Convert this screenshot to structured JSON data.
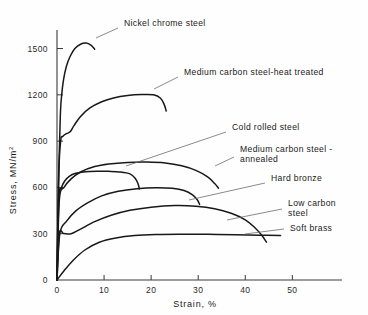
{
  "chart_data": {
    "type": "line",
    "title": "",
    "xlabel": "Strain,  %",
    "ylabel": "Stress,   MN/m",
    "ylabel_sup": "2",
    "xlim": [
      0,
      58
    ],
    "ylim": [
      0,
      1620
    ],
    "xticks": [
      0,
      10,
      20,
      30,
      40,
      50
    ],
    "xtick_labels": [
      "0",
      "10",
      "20",
      "30",
      "40",
      "50"
    ],
    "yticks": [
      0,
      300,
      600,
      900,
      1200,
      1500
    ],
    "ytick_labels": [
      "0",
      "300",
      "600",
      "900",
      "1200",
      "1500"
    ],
    "grid": false,
    "legend": "annotations",
    "series": [
      {
        "name": "Nickel chrome steel",
        "points": [
          [
            0,
            0
          ],
          [
            0.3,
            620
          ],
          [
            0.7,
            1060
          ],
          [
            1.0,
            1200
          ],
          [
            1.4,
            1300
          ],
          [
            2.0,
            1385
          ],
          [
            2.8,
            1450
          ],
          [
            3.8,
            1500
          ],
          [
            5.0,
            1528
          ],
          [
            6.2,
            1535
          ],
          [
            7.2,
            1522
          ],
          [
            8.0,
            1496
          ]
        ]
      },
      {
        "name": "Medium carbon steel-heat treated",
        "points": [
          [
            0,
            0
          ],
          [
            0.4,
            700
          ],
          [
            0.8,
            905
          ],
          [
            1.2,
            930
          ],
          [
            2.0,
            948
          ],
          [
            2.8,
            960
          ],
          [
            3.6,
            1000
          ],
          [
            5.0,
            1060
          ],
          [
            7.0,
            1115
          ],
          [
            9.5,
            1155
          ],
          [
            12.0,
            1180
          ],
          [
            15.0,
            1196
          ],
          [
            18.0,
            1202
          ],
          [
            20.5,
            1200
          ],
          [
            22.0,
            1178
          ],
          [
            22.8,
            1135
          ],
          [
            23.2,
            1095
          ]
        ]
      },
      {
        "name": "Cold rolled steel",
        "points": [
          [
            0,
            0
          ],
          [
            0.5,
            520
          ],
          [
            1.5,
            600
          ],
          [
            3.0,
            655
          ],
          [
            5.0,
            700
          ],
          [
            8.0,
            735
          ],
          [
            11.0,
            752
          ],
          [
            15.0,
            762
          ],
          [
            19.0,
            764
          ],
          [
            23.0,
            758
          ],
          [
            26.5,
            740
          ],
          [
            29.5,
            710
          ],
          [
            32.0,
            668
          ],
          [
            33.5,
            625
          ],
          [
            34.3,
            595
          ]
        ]
      },
      {
        "name": "Medium carbon steel - annealed",
        "points": [
          [
            0,
            0
          ],
          [
            0.4,
            530
          ],
          [
            0.9,
            595
          ],
          [
            1.6,
            640
          ],
          [
            2.6,
            672
          ],
          [
            4.0,
            692
          ],
          [
            6.0,
            702
          ],
          [
            8.5,
            705
          ],
          [
            11.0,
            704
          ],
          [
            13.5,
            700
          ],
          [
            15.5,
            688
          ],
          [
            16.6,
            660
          ],
          [
            17.2,
            625
          ],
          [
            17.5,
            590
          ]
        ]
      },
      {
        "name": "Hard bronze",
        "points": [
          [
            0,
            0
          ],
          [
            0.6,
            300
          ],
          [
            2.0,
            380
          ],
          [
            4.0,
            448
          ],
          [
            6.5,
            500
          ],
          [
            9.5,
            545
          ],
          [
            13.0,
            575
          ],
          [
            17.0,
            592
          ],
          [
            21.0,
            598
          ],
          [
            24.5,
            594
          ],
          [
            27.0,
            580
          ],
          [
            28.8,
            552
          ],
          [
            29.8,
            520
          ],
          [
            30.3,
            490
          ]
        ]
      },
      {
        "name": "Low carbon steel",
        "points": [
          [
            0,
            0
          ],
          [
            0.5,
            300
          ],
          [
            1.4,
            302
          ],
          [
            3.0,
            300
          ],
          [
            5.0,
            330
          ],
          [
            8.0,
            378
          ],
          [
            11.5,
            420
          ],
          [
            15.5,
            452
          ],
          [
            20.0,
            472
          ],
          [
            25.0,
            482
          ],
          [
            29.5,
            478
          ],
          [
            33.5,
            462
          ],
          [
            37.0,
            432
          ],
          [
            40.0,
            390
          ],
          [
            42.0,
            340
          ],
          [
            43.5,
            290
          ],
          [
            44.5,
            245
          ]
        ]
      },
      {
        "name": "Soft brass",
        "points": [
          [
            0,
            0
          ],
          [
            1.5,
            60
          ],
          [
            3.5,
            130
          ],
          [
            6.0,
            196
          ],
          [
            9.0,
            245
          ],
          [
            12.5,
            272
          ],
          [
            16.5,
            288
          ],
          [
            21.0,
            295
          ],
          [
            26.0,
            297
          ],
          [
            32.0,
            296
          ],
          [
            38.0,
            293
          ],
          [
            43.0,
            290
          ],
          [
            47.5,
            288
          ]
        ]
      }
    ],
    "annotations": [
      {
        "label": "Nickel chrome steel",
        "x": 124,
        "y": 26,
        "leader": "M 118 28 L 96 38"
      },
      {
        "label": "Medium carbon steel-heat treated",
        "x": 184,
        "y": 75,
        "leader": "M 178 77 L 154 89"
      },
      {
        "label": "Cold rolled steel",
        "x": 232,
        "y": 130,
        "leader": "M 226 132 L 126 166"
      },
      {
        "label": "Medium carbon steel -",
        "x": 240,
        "y": 152,
        "leader": "M 234 157 L 215 166"
      },
      {
        "label": "annealed",
        "x": 240,
        "y": 162,
        "leader": ""
      },
      {
        "label": "Hard bronze",
        "x": 271,
        "y": 181,
        "leader": "M 265 183 L 189 200"
      },
      {
        "label": "Low carbon",
        "x": 288,
        "y": 206,
        "leader": "M 282 209 L 227 220"
      },
      {
        "label": "steel",
        "x": 288,
        "y": 216,
        "leader": ""
      },
      {
        "label": "Soft brass",
        "x": 290,
        "y": 231,
        "leader": "M 284 229 L 245 234"
      }
    ]
  }
}
